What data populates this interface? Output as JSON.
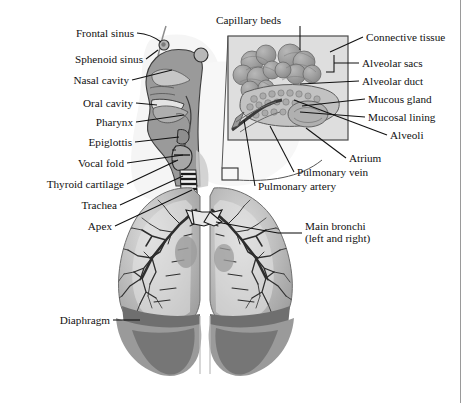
{
  "figure": {
    "title_remnant": "",
    "caption": "Respiratory system anatomy"
  },
  "colors": {
    "ink": "#111111",
    "leader": "#111111",
    "background": "#ffffff",
    "tissue_mid": "#9a9a9a",
    "tissue_light": "#c9c9c9",
    "tissue_pale": "#e2e2e2",
    "lung_fill": "#b4b4b4",
    "lung_inner": "#d2d2d2",
    "diaphragm": "#8a8a8a",
    "diaphragm_dark": "#6f6f6f",
    "bronchi": "#3a3a3a",
    "inset_fill": "#dedede",
    "inset_border": "#4a4a4a",
    "alveoli_cluster": "#a2a2a2",
    "page_rule": "#9a9a9a"
  },
  "labels_left": [
    {
      "id": "frontal-sinus",
      "text": "Frontal sinus",
      "x": 134,
      "y": 33
    },
    {
      "id": "sphenoid-sinus",
      "text": "Sphenoid sinus",
      "x": 143,
      "y": 59
    },
    {
      "id": "nasal-cavity",
      "text": "Nasal cavity",
      "x": 129,
      "y": 80
    },
    {
      "id": "oral-cavity",
      "text": "Oral cavity",
      "x": 133,
      "y": 103
    },
    {
      "id": "pharynx",
      "text": "Pharynx",
      "x": 133,
      "y": 122
    },
    {
      "id": "epiglottis",
      "text": "Epiglottis",
      "x": 132,
      "y": 142
    },
    {
      "id": "vocal-fold",
      "text": "Vocal fold",
      "x": 124,
      "y": 163
    },
    {
      "id": "thyroid-cartilage",
      "text": "Thyroid cartilage",
      "x": 124,
      "y": 184
    },
    {
      "id": "trachea",
      "text": "Trachea",
      "x": 117,
      "y": 205
    },
    {
      "id": "apex",
      "text": "Apex",
      "x": 112,
      "y": 226
    },
    {
      "id": "diaphragm",
      "text": "Diaphragm",
      "x": 110,
      "y": 320
    }
  ],
  "labels_right": [
    {
      "id": "capillary-beds",
      "text": "Capillary beds",
      "x": 281,
      "y": 20
    },
    {
      "id": "connective-tissue",
      "text": "Connective tissue",
      "x": 366,
      "y": 37
    },
    {
      "id": "alveolar-sacs",
      "text": "Alveolar sacs",
      "x": 362,
      "y": 63
    },
    {
      "id": "alveolar-duct",
      "text": "Alveolar duct",
      "x": 362,
      "y": 81
    },
    {
      "id": "mucous-gland",
      "text": "Mucous gland",
      "x": 368,
      "y": 99
    },
    {
      "id": "mucosal-lining",
      "text": "Mucosal lining",
      "x": 368,
      "y": 117
    },
    {
      "id": "alveoli",
      "text": "Alveoli",
      "x": 390,
      "y": 135
    }
  ],
  "labels_lower": [
    {
      "id": "atrium",
      "text": "Atrium",
      "x": 349,
      "y": 158
    },
    {
      "id": "pulmonary-vein",
      "text": "Pulmonary vein",
      "x": 297,
      "y": 172
    },
    {
      "id": "pulmonary-artery",
      "text": "Pulmonary artery",
      "x": 258,
      "y": 186
    }
  ],
  "labels_multiline": [
    {
      "id": "main-bronchi",
      "line1": "Main bronchi",
      "line2": "(left and right)",
      "x": 305,
      "y": 233
    }
  ],
  "structures": [
    "head-sagittal-section",
    "nasal-cavity-shape",
    "oral-cavity-shape",
    "pharynx-shape",
    "larynx-epiglottis",
    "trachea-with-cartilage-rings",
    "left-lung",
    "right-lung",
    "bronchial-tree",
    "diaphragm-band",
    "alveoli-inset-box",
    "magnification-cone"
  ]
}
